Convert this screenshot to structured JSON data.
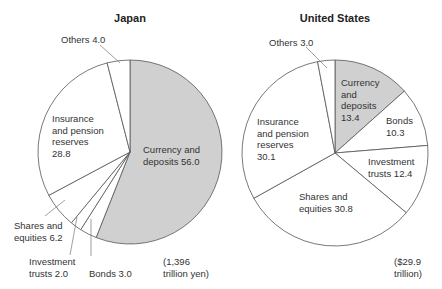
{
  "chart_data": [
    {
      "type": "pie",
      "title": "Japan",
      "total_note": "(1,396\ntrillion yen)",
      "start_angle_deg": 0,
      "direction": "clockwise",
      "slices": [
        {
          "label": "Currency and deposits",
          "value": 56.0,
          "color": "#d0d0d0"
        },
        {
          "label": "Bonds",
          "value": 3.0,
          "color": "#ffffff"
        },
        {
          "label": "Investment trusts",
          "value": 2.0,
          "color": "#ffffff"
        },
        {
          "label": "Shares and equities",
          "value": 6.2,
          "color": "#ffffff"
        },
        {
          "label": "Insurance and pension reserves",
          "value": 28.8,
          "color": "#ffffff"
        },
        {
          "label": "Others",
          "value": 4.0,
          "color": "#ffffff"
        }
      ],
      "geometry": {
        "cx": 130,
        "cy": 152,
        "r": 92
      }
    },
    {
      "type": "pie",
      "title": "United States",
      "total_note": "($29.9\ntrillion)",
      "start_angle_deg": 0,
      "direction": "clockwise",
      "slices": [
        {
          "label": "Currency and deposits",
          "value": 13.4,
          "color": "#d0d0d0"
        },
        {
          "label": "Bonds",
          "value": 10.3,
          "color": "#ffffff"
        },
        {
          "label": "Investment trusts",
          "value": 12.4,
          "color": "#ffffff"
        },
        {
          "label": "Shares and equities",
          "value": 30.8,
          "color": "#ffffff"
        },
        {
          "label": "Insurance and pension reserves",
          "value": 30.1,
          "color": "#ffffff"
        },
        {
          "label": "Others",
          "value": 3.0,
          "color": "#ffffff"
        }
      ],
      "geometry": {
        "cx": 335,
        "cy": 153,
        "r": 93
      }
    }
  ],
  "labels": {
    "japan": {
      "title": "Japan",
      "others": "Others 4.0",
      "insurance": "Insurance\nand pension\nreserves\n28.8",
      "currency": "Currency and\ndeposits 56.0",
      "shares": "Shares and\nequities 6.2",
      "investment": "Investment\ntrusts 2.0",
      "bonds": "Bonds 3.0",
      "total": "(1,396\ntrillion yen)"
    },
    "us": {
      "title": "United States",
      "others": "Others 3.0",
      "currency": "Currency\nand\ndeposits\n13.4",
      "bonds": "Bonds\n10.3",
      "insurance": "Insurance\nand pension\nreserves\n30.1",
      "investment": "Investment\ntrusts 12.4",
      "shares": "Shares and\nequities 30.8",
      "total": "($29.9\ntrillion)"
    }
  },
  "style": {
    "stroke": "#555555",
    "highlight_fill": "#d0d0d0"
  }
}
